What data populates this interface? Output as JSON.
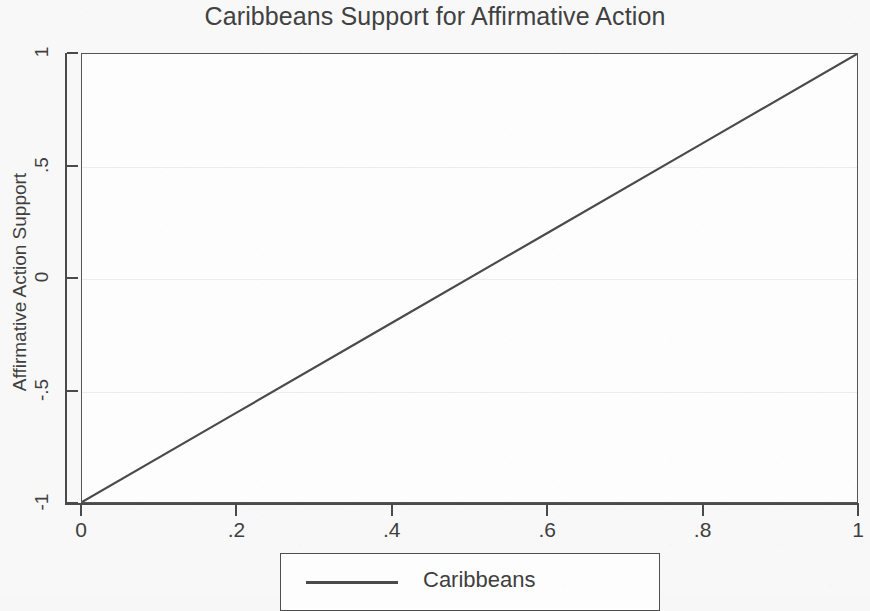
{
  "chart_data": {
    "type": "line",
    "title": "Caribbeans Support for Affirmative Action",
    "xlabel": "",
    "ylabel": "Affirmative Action Support",
    "xlim": [
      0,
      1
    ],
    "ylim": [
      -1,
      1
    ],
    "xticks": [
      "0",
      ".2",
      ".4",
      ".6",
      ".8",
      "1"
    ],
    "xtick_values": [
      0,
      0.2,
      0.4,
      0.6,
      0.8,
      1
    ],
    "yticks": [
      "1",
      ".5",
      "0",
      "-.5",
      "-1"
    ],
    "ytick_values": [
      1,
      0.5,
      0,
      -0.5,
      -1
    ],
    "grid": true,
    "grid_axis": "y",
    "legend_position": "bottom-center",
    "series": [
      {
        "name": "Caribbeans",
        "color": "#4a4a4a",
        "x": [
          0,
          0.2,
          0.4,
          0.6,
          0.8,
          1
        ],
        "values": [
          -1,
          -0.6,
          -0.2,
          0.2,
          0.6,
          1
        ]
      }
    ]
  },
  "legend": {
    "entries": [
      {
        "label": "Caribbeans"
      }
    ]
  },
  "colors": {
    "line": "#4a4a4a",
    "axis": "#4a4a4a",
    "plot_background": "#fdfdfd",
    "figure_background": "#f7f7f7",
    "gridline": "#ececec",
    "text": "#3f3f3f"
  }
}
